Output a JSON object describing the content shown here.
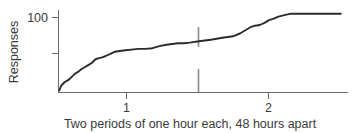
{
  "chart_data": {
    "type": "line",
    "title": "",
    "subtitle": "",
    "xlabel": "Two periods of one hour each, 48 hours apart",
    "ylabel": "Responses",
    "grid": false,
    "legend": "none",
    "xlim": [
      0,
      2.45
    ],
    "ylim": [
      0,
      125
    ],
    "x_ticks": [
      1,
      2
    ],
    "x_tick_labels": [
      "1",
      "2"
    ],
    "y_ticks": [
      50,
      100
    ],
    "y_tick_labels": [
      "",
      "100"
    ],
    "annotations": [
      {
        "name": "session-break-upper-marker",
        "x": 1.49,
        "y_from": 55,
        "y_to": 82,
        "note": "vertical marker crossing the cumulative record"
      },
      {
        "name": "session-break-lower-marker",
        "x": 1.49,
        "y_from": 0,
        "y_to": 31,
        "note": "vertical marker rising from the baseline"
      }
    ],
    "series": [
      {
        "name": "Cumulative responses",
        "color": "#2b2b2b",
        "x": [
          0.0,
          0.02,
          0.05,
          0.07,
          0.09,
          0.12,
          0.14,
          0.17,
          0.19,
          0.22,
          0.25,
          0.28,
          0.31,
          0.34,
          0.37,
          0.4,
          0.44,
          0.48,
          0.52,
          0.57,
          0.62,
          0.68,
          0.74,
          0.8,
          0.86,
          0.92,
          0.97,
          1.02,
          1.07,
          1.12,
          1.2,
          1.3,
          1.4,
          1.49,
          1.55,
          1.6,
          1.64,
          1.68,
          1.72,
          1.76,
          1.8,
          1.84,
          1.88,
          1.93,
          1.98,
          2.05,
          2.15,
          2.25,
          2.35,
          2.42
        ],
        "y": [
          2,
          10,
          15,
          17,
          19,
          24,
          27,
          30,
          33,
          36,
          39,
          42,
          47,
          49,
          50,
          52,
          55,
          58,
          59,
          60,
          61,
          62,
          62,
          63,
          66,
          68,
          69,
          70,
          70,
          71,
          73,
          75,
          78,
          80,
          84,
          89,
          93,
          95,
          96,
          99,
          103,
          105,
          108,
          110,
          112,
          112,
          112,
          112,
          112,
          112
        ]
      }
    ]
  },
  "axis": {
    "y_label": "Responses",
    "y_tick_100": "100",
    "x_tick_1": "1",
    "x_tick_2": "2"
  },
  "caption": {
    "text": "Two periods of one hour each, 48 hours apart"
  },
  "colors": {
    "curve": "#2b2b2b",
    "axis": "#6b6b6b",
    "marker": "#8a8a8a",
    "text": "#3a3a3a",
    "background": "#ffffff"
  }
}
